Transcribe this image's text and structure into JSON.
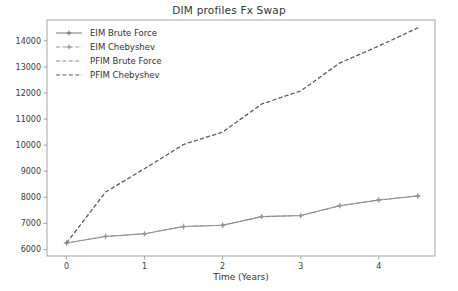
{
  "chart_data": {
    "type": "line",
    "title": "DIM profiles Fx Swap",
    "xlabel": "Time (Years)",
    "ylabel": "",
    "xlim": [
      -0.25,
      4.72
    ],
    "ylim": [
      5750,
      14800
    ],
    "xticks": [
      0,
      1,
      2,
      3,
      4
    ],
    "xtick_labels": [
      "0",
      "1",
      "2",
      "3",
      "4"
    ],
    "yticks": [
      6000,
      7000,
      8000,
      9000,
      10000,
      11000,
      12000,
      13000,
      14000
    ],
    "ytick_labels": [
      "6000",
      "7000",
      "8000",
      "9000",
      "10000",
      "11000",
      "12000",
      "13000",
      "14000"
    ],
    "grid": false,
    "legend_position": "upper left",
    "x": [
      0,
      0.5,
      1,
      1.5,
      2,
      2.5,
      3,
      3.5,
      4,
      4.5
    ],
    "series": [
      {
        "name": "EIM Brute Force",
        "values": [
          6250,
          6500,
          6600,
          6880,
          6930,
          7260,
          7300,
          7680,
          7900,
          8050
        ],
        "color": "#7f7f7f",
        "linestyle": "solid",
        "marker": "star"
      },
      {
        "name": "EIM Chebyshev",
        "values": [
          6250,
          6500,
          6600,
          6880,
          6930,
          7260,
          7300,
          7680,
          7900,
          8050
        ],
        "color": "#9a9a9a",
        "linestyle": "dashed",
        "marker": "star"
      },
      {
        "name": "PFIM Brute Force",
        "values": [
          6250,
          8200,
          9100,
          10030,
          10500,
          11580,
          12080,
          13150,
          13800,
          14500
        ],
        "color": "#8a8a8a",
        "linestyle": "dashed",
        "marker": "none"
      },
      {
        "name": "PFIM Chebyshev",
        "values": [
          6250,
          8200,
          9100,
          10030,
          10500,
          11580,
          12080,
          13150,
          13800,
          14500
        ],
        "color": "#5a5a5a",
        "linestyle": "dashed",
        "marker": "none"
      }
    ]
  },
  "axes": {
    "spine_color": "#9b9b9b",
    "tick_color": "#9b9b9b"
  },
  "legend": {
    "items": [
      {
        "label": "EIM Brute Force"
      },
      {
        "label": "EIM Chebyshev"
      },
      {
        "label": "PFIM Brute Force"
      },
      {
        "label": "PFIM Chebyshev"
      }
    ]
  }
}
